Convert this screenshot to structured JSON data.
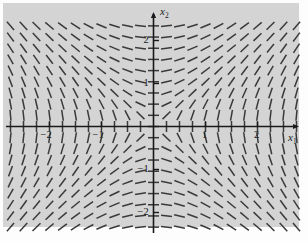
{
  "figure": {
    "kind": "direction-field",
    "background_color": "#d4d4d4",
    "stroke_color": "#3a3a3a",
    "axis_color": "#1a1a1a"
  },
  "axes": {
    "x_label": "x",
    "x_subscript": "1",
    "y_label": "x",
    "y_subscript": "2",
    "x_ticks": [
      {
        "value": -2,
        "label": "−2"
      },
      {
        "value": -1,
        "label": "−1"
      },
      {
        "value": 1,
        "label": "1"
      },
      {
        "value": 2,
        "label": "2"
      }
    ],
    "y_ticks": [
      {
        "value": 2,
        "label": "2"
      },
      {
        "value": 1,
        "label": "1"
      },
      {
        "value": -1,
        "label": "−1"
      },
      {
        "value": -2,
        "label": "−2"
      }
    ]
  },
  "chart_data": {
    "type": "scatter",
    "title": "",
    "xlabel": "x1",
    "ylabel": "x2",
    "xlim": [
      -2.85,
      2.85
    ],
    "ylim": [
      -2.55,
      2.55
    ],
    "grid": false,
    "legend": null,
    "field": {
      "description": "Direction field of a planar autonomous system; short line segments drawn tangent to trajectories on a rectangular grid.",
      "dx_expression": "x2",
      "dy_expression": "x1",
      "grid_nx": 23,
      "grid_ny": 19,
      "segment_length_px": 11,
      "segments_drawn": 437
    }
  }
}
